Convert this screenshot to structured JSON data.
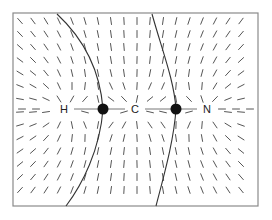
{
  "figure": {
    "frame": {
      "x": 13,
      "y": 13,
      "width": 245,
      "height": 193,
      "stroke": "#8a8a8a"
    },
    "axis_y": 109
  },
  "atoms": [
    {
      "label": "H",
      "x": 64,
      "y": 109
    },
    {
      "label": "C",
      "x": 135,
      "y": 109
    },
    {
      "label": "N",
      "x": 207,
      "y": 109
    }
  ],
  "critical_points": [
    {
      "name": "bond-critical-point-H-C",
      "x": 103,
      "y": 109
    },
    {
      "name": "bond-critical-point-C-N",
      "x": 176,
      "y": 109
    }
  ],
  "bonds": [
    {
      "x1": 74,
      "x2": 125
    },
    {
      "x1": 145,
      "x2": 197
    }
  ],
  "surfaces": [
    {
      "name": "zero-flux-surface-H-C",
      "path": "M57 14 C 85 40, 100 70, 103 109 C 100 150, 82 185, 66 206"
    },
    {
      "name": "zero-flux-surface-C-N",
      "path": "M152 14 C 162 50, 174 80, 176 109 C 174 140, 164 175, 156 206"
    }
  ],
  "colors": {
    "dash": "#555555",
    "surface": "#333333",
    "nucleus": "#111111",
    "label": "#222222"
  }
}
